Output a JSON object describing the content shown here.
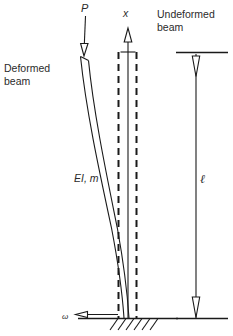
{
  "figure": {
    "type": "engineering-diagram",
    "background_color": "#ffffff",
    "ink_color": "#1a1a1a",
    "text_color": "#2b2b2b"
  },
  "labels": {
    "deformed_beam": "Deformed\nbeam",
    "undeformed_beam": "Undeformed\nbeam",
    "load": "P",
    "axis_x": "x",
    "section_properties": "EI, m",
    "length": "ℓ",
    "ground_motion": "ω"
  },
  "geometry": {
    "beam_top_y": 52,
    "beam_base_y": 318,
    "undeformed_axis_x": 128,
    "dashed_left_x": 118,
    "dashed_right_x": 136,
    "deformed_top_x": 82,
    "deformed_base_x": 127,
    "dimension_line_x": 196,
    "load_arrow_x": 88,
    "load_arrow_top_y": 16
  },
  "icons": {
    "load_arrow": "arrow-down-icon",
    "axis_arrow": "arrow-up-icon",
    "dimension_arrow_top": "arrow-down-icon",
    "dimension_arrow_bottom": "arrow-down-icon",
    "ground_motion_arrow": "arrow-left-icon",
    "support": "fixed-support-hatching-icon"
  }
}
